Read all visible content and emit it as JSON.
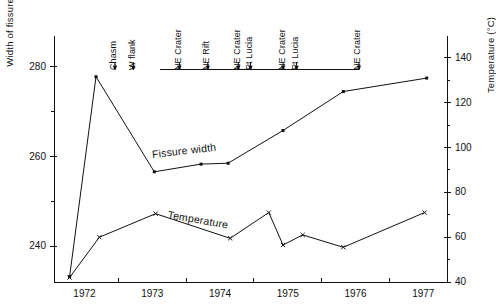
{
  "chart_data": {
    "type": "line",
    "title": "",
    "xlabel": "",
    "ylabel": "Width of fissure (cm)",
    "y2label": "Temperature (°C)",
    "xlim": [
      1971.55,
      1977.35
    ],
    "ylim": [
      232,
      286
    ],
    "y2lim": [
      40,
      148
    ],
    "grid": false,
    "legend_position": "inline-annotation",
    "xticks": [
      "1972",
      "1973",
      "1974",
      "1975",
      "1976",
      "1977"
    ],
    "xtick_values": [
      1972,
      1973,
      1974,
      1975,
      1976,
      1977
    ],
    "yticks": [
      "240",
      "260",
      "280"
    ],
    "ytick_values": [
      240,
      260,
      280
    ],
    "yminor_values": [
      250,
      270
    ],
    "y2ticks": [
      "40",
      "60",
      "80",
      "100",
      "120",
      "140"
    ],
    "y2tick_values": [
      40,
      60,
      80,
      100,
      120,
      140
    ],
    "y2minor_values": [
      50,
      70,
      90,
      110,
      130
    ],
    "series": [
      {
        "name": "Fissure width",
        "axis": "left",
        "marker": "square",
        "unit": "cm",
        "x": [
          1971.78,
          1972.17,
          1973.03,
          1973.72,
          1974.12,
          1974.93,
          1975.82,
          1977.05
        ],
        "values": [
          233.2,
          277.8,
          256.6,
          258.3,
          258.5,
          265.8,
          274.5,
          277.5
        ]
      },
      {
        "name": "Temperature",
        "axis": "right",
        "marker": "cross",
        "unit": "°C",
        "x": [
          1971.78,
          1972.22,
          1973.05,
          1974.15,
          1974.72,
          1974.93,
          1975.22,
          1975.82,
          1977.02
        ],
        "values": [
          42.0,
          60.0,
          70.5,
          59.5,
          71.0,
          56.5,
          61.0,
          55.5,
          71.0
        ]
      }
    ],
    "events": {
      "axis_line_from": 1973.12,
      "axis_line_to": 1976.05,
      "items": [
        {
          "label": "Chasm",
          "x": 1972.45
        },
        {
          "label": "W flank",
          "x": 1972.72
        },
        {
          "label": "NE Crater",
          "x": 1973.4
        },
        {
          "label": "NE Rift",
          "x": 1973.82
        },
        {
          "label": "NE Crater",
          "x": 1974.27
        },
        {
          "label": "Pt Lucia",
          "x": 1974.45
        },
        {
          "label": "NE Crater",
          "x": 1974.93
        },
        {
          "label": "Pt Lucia",
          "x": 1975.13
        },
        {
          "label": "NE Crater",
          "x": 1976.05
        }
      ]
    }
  },
  "labels": {
    "series_fissure": "Fissure width",
    "series_temperature": "Temperature",
    "y_left": "Width of fissure (cm)",
    "y_right": "Temperature (°C)"
  },
  "colors": {
    "ink": "#111111",
    "axis": "#111111",
    "background": "#ffffff"
  }
}
